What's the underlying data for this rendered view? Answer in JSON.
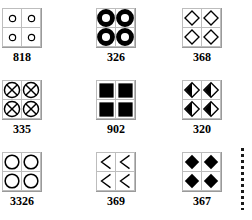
{
  "page": {
    "background_color": "#ffffff",
    "ink_color": "#000000",
    "grid_border_color": "#9a9a9a",
    "cell_border_color": "#bdbdbd"
  },
  "decorations": [
    {
      "name": "vertical-dotted-rule",
      "style": "dotted",
      "orientation": "vertical"
    }
  ],
  "patterns": [
    {
      "label": "818",
      "glyph": "small-open-circle",
      "glyph_fill": "none",
      "glyph_stroke": "#000000",
      "x": 2,
      "y": 8
    },
    {
      "label": "326",
      "glyph": "thick-ring",
      "glyph_fill": "#000000",
      "glyph_stroke": "#000000",
      "x": 96,
      "y": 8
    },
    {
      "label": "368",
      "glyph": "open-diamond",
      "glyph_fill": "none",
      "glyph_stroke": "#000000",
      "x": 182,
      "y": 8
    },
    {
      "label": "335",
      "glyph": "crossed-circle",
      "glyph_fill": "none",
      "glyph_stroke": "#000000",
      "x": 2,
      "y": 80
    },
    {
      "label": "902",
      "glyph": "filled-square",
      "glyph_fill": "#000000",
      "glyph_stroke": "#000000",
      "x": 96,
      "y": 80
    },
    {
      "label": "320",
      "glyph": "half-filled-diamond",
      "glyph_fill": "#000000",
      "glyph_stroke": "#000000",
      "x": 182,
      "y": 80
    },
    {
      "label": "3326",
      "glyph": "open-circle",
      "glyph_fill": "none",
      "glyph_stroke": "#000000",
      "x": 2,
      "y": 152
    },
    {
      "label": "369",
      "glyph": "left-chevron",
      "glyph_fill": "none",
      "glyph_stroke": "#000000",
      "x": 96,
      "y": 152
    },
    {
      "label": "367",
      "glyph": "filled-diamond",
      "glyph_fill": "#000000",
      "glyph_stroke": "#000000",
      "x": 182,
      "y": 152
    }
  ]
}
